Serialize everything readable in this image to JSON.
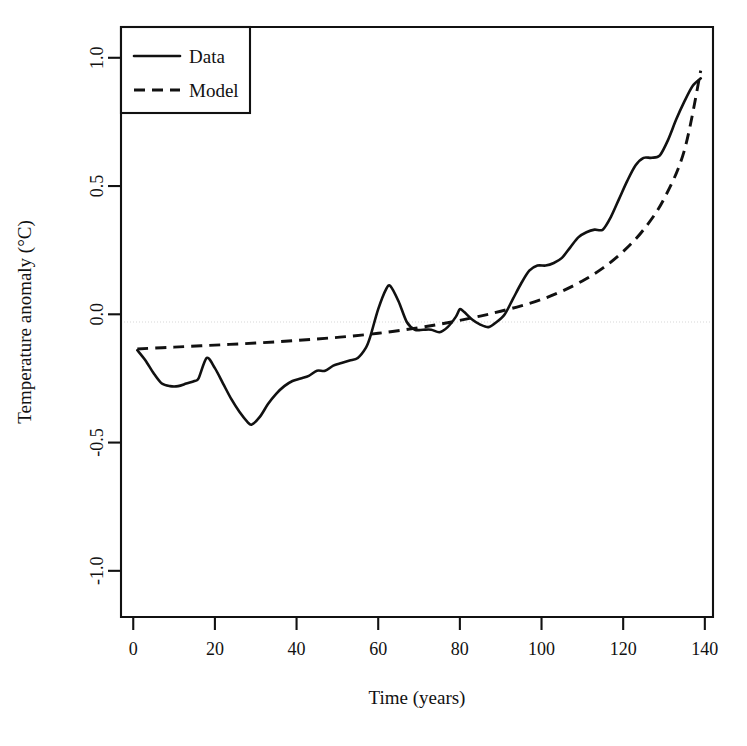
{
  "chart_data": {
    "type": "line",
    "title": "",
    "xlabel": "Time (years)",
    "ylabel": "Temperature anomaly (°C)",
    "xlim": [
      -3,
      142
    ],
    "ylim": [
      -1.18,
      1.12
    ],
    "xticks": [
      0,
      20,
      40,
      60,
      80,
      100,
      120,
      140
    ],
    "xticklabels": [
      "0",
      "20",
      "40",
      "60",
      "80",
      "100",
      "120",
      "140"
    ],
    "yticks": [
      -1.0,
      -0.5,
      0.0,
      0.5,
      1.0
    ],
    "yticklabels": [
      "-1.0",
      "-0.5",
      "0.0",
      "0.5",
      "1.0"
    ],
    "grid": "zero-line-only",
    "legend_position": "top-left",
    "legend_entries": [
      {
        "label": "Data",
        "style": "solid"
      },
      {
        "label": "Model",
        "style": "dashed"
      }
    ],
    "series": [
      {
        "name": "Data",
        "style": "solid",
        "x": [
          1,
          3,
          5,
          7,
          9,
          11,
          13,
          15,
          16,
          18,
          20,
          22,
          24,
          26,
          28,
          29,
          31,
          33,
          35,
          37,
          39,
          41,
          43,
          45,
          47,
          49,
          51,
          53,
          55,
          57,
          58,
          60,
          62,
          63,
          65,
          67,
          69,
          71,
          73,
          75,
          77,
          79,
          80,
          81,
          83,
          85,
          87,
          89,
          91,
          93,
          95,
          97,
          99,
          101,
          103,
          105,
          107,
          109,
          111,
          113,
          115,
          117,
          119,
          121,
          123,
          125,
          127,
          129,
          131,
          133,
          135,
          137,
          139
        ],
        "y": [
          -0.14,
          -0.18,
          -0.23,
          -0.27,
          -0.28,
          -0.28,
          -0.27,
          -0.26,
          -0.25,
          -0.17,
          -0.21,
          -0.27,
          -0.33,
          -0.38,
          -0.42,
          -0.43,
          -0.4,
          -0.35,
          -0.31,
          -0.28,
          -0.26,
          -0.25,
          -0.24,
          -0.22,
          -0.22,
          -0.2,
          -0.19,
          -0.18,
          -0.17,
          -0.13,
          -0.09,
          0.02,
          0.1,
          0.11,
          0.05,
          -0.03,
          -0.06,
          -0.06,
          -0.06,
          -0.07,
          -0.05,
          -0.01,
          0.02,
          0.01,
          -0.02,
          -0.04,
          -0.05,
          -0.03,
          0.0,
          0.06,
          0.12,
          0.17,
          0.19,
          0.19,
          0.2,
          0.22,
          0.26,
          0.3,
          0.32,
          0.33,
          0.33,
          0.38,
          0.45,
          0.52,
          0.58,
          0.61,
          0.61,
          0.62,
          0.68,
          0.76,
          0.83,
          0.89,
          0.92
        ]
      },
      {
        "name": "Model",
        "style": "dashed",
        "x": [
          1,
          10,
          20,
          30,
          40,
          50,
          60,
          70,
          78,
          85,
          90,
          95,
          100,
          105,
          110,
          115,
          120,
          125,
          130,
          135,
          139
        ],
        "y": [
          -0.135,
          -0.128,
          -0.12,
          -0.112,
          -0.102,
          -0.09,
          -0.074,
          -0.052,
          -0.03,
          -0.007,
          0.012,
          0.033,
          0.058,
          0.09,
          0.13,
          0.18,
          0.245,
          0.33,
          0.45,
          0.64,
          0.95
        ]
      }
    ],
    "annotations": []
  }
}
